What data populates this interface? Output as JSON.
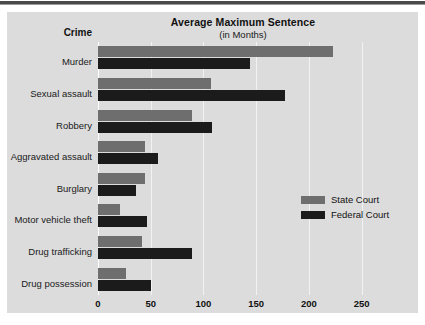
{
  "chart_data": {
    "type": "bar",
    "orientation": "horizontal",
    "title": "Average Maximum Sentence",
    "subtitle": "(in Months)",
    "category_axis_title": "Crime",
    "xlabel": "",
    "ylabel": "Crime",
    "categories": [
      "Murder",
      "Sexual assault",
      "Robbery",
      "Aggravated assault",
      "Burglary",
      "Motor vehicle theft",
      "Drug trafficking",
      "Drug possession"
    ],
    "series": [
      {
        "name": "State Court",
        "color": "#6e6e6e",
        "values": [
          223,
          107,
          89,
          45,
          45,
          21,
          42,
          27
        ]
      },
      {
        "name": "Federal Court",
        "color": "#1b1b1b",
        "values": [
          144,
          177,
          108,
          57,
          36,
          46,
          89,
          50
        ]
      }
    ],
    "xlim": [
      0,
      275
    ],
    "xticks": [
      0,
      50,
      100,
      150,
      200,
      250
    ],
    "xtick_labels": [
      "0",
      "50",
      "100",
      "150",
      "200",
      "250"
    ],
    "grid": true,
    "grid_axis": "x",
    "legend_position": "right-middle",
    "background_color": "#dcdcdc",
    "gridline_color": "#f2f2f2"
  },
  "legend": {
    "entries": [
      {
        "label": "State Court",
        "color": "#6e6e6e"
      },
      {
        "label": "Federal Court",
        "color": "#1b1b1b"
      }
    ]
  }
}
